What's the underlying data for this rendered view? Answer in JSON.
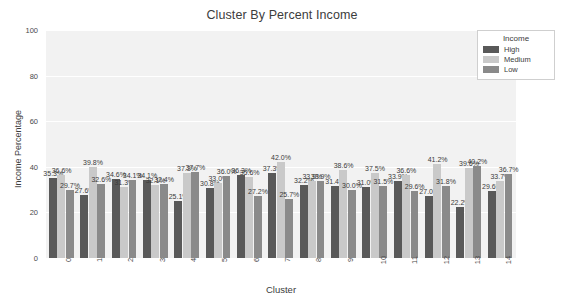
{
  "chart_data": {
    "type": "bar",
    "title": "Cluster By Percent Income",
    "xlabel": "Cluster",
    "ylabel": "Income Percentage",
    "ylim": [
      0,
      100
    ],
    "yticks": [
      "0",
      "20",
      "40",
      "60",
      "80",
      "100"
    ],
    "grid": true,
    "legend_title": "Income",
    "legend_position": "upper right outside",
    "categories": [
      "0",
      "1",
      "2",
      "3",
      "4",
      "5",
      "6",
      "7",
      "8",
      "9",
      "10",
      "11",
      "12",
      "13",
      "14"
    ],
    "series": [
      {
        "name": "High",
        "color": "#595959",
        "values": [
          35.3,
          27.6,
          34.6,
          34.1,
          25.1,
          30.8,
          36.3,
          37.3,
          32.2,
          31.4,
          31.0,
          33.9,
          27.0,
          22.2,
          29.6
        ],
        "labels": [
          "35.3%",
          "27.6%",
          "34.6%",
          "34.1%",
          "25.1%",
          "30.8%",
          "36.3%",
          "37.3%",
          "32.2%",
          "31.4%",
          "31.0%",
          "33.9%",
          "27.0%",
          "22.2%",
          "29.6%"
        ]
      },
      {
        "name": "Medium",
        "color": "#c9c9c9",
        "values": [
          36.6,
          39.8,
          31.3,
          32.1,
          37.3,
          33.0,
          35.6,
          42.0,
          33.9,
          38.6,
          37.5,
          36.6,
          41.2,
          39.6,
          33.7
        ],
        "labels": [
          "36.6%",
          "39.8%",
          "31.3%",
          "32.1%",
          "37.3%",
          "33.0%",
          "35.6%",
          "42.0%",
          "33.9%",
          "38.6%",
          "37.5%",
          "36.6%",
          "41.2%",
          "39.6%",
          "33.7%"
        ]
      },
      {
        "name": "Low",
        "color": "#8a8a8a",
        "values": [
          29.7,
          32.6,
          34.1,
          32.4,
          37.7,
          36.0,
          27.2,
          25.7,
          33.9,
          30.0,
          31.5,
          29.6,
          31.8,
          40.2,
          36.7
        ],
        "labels": [
          "29.7%",
          "32.6%",
          "34.1%",
          "32.4%",
          "37.7%",
          "36.0%",
          "27.2%",
          "25.7%",
          "33.9%",
          "30.0%",
          "31.5%",
          "29.6%",
          "31.8%",
          "40.2%",
          "36.7%"
        ]
      }
    ]
  },
  "legend": {
    "title": "Income",
    "entries": [
      {
        "label": "High",
        "color": "#595959"
      },
      {
        "label": "Medium",
        "color": "#c9c9c9"
      },
      {
        "label": "Low",
        "color": "#8a8a8a"
      }
    ]
  }
}
